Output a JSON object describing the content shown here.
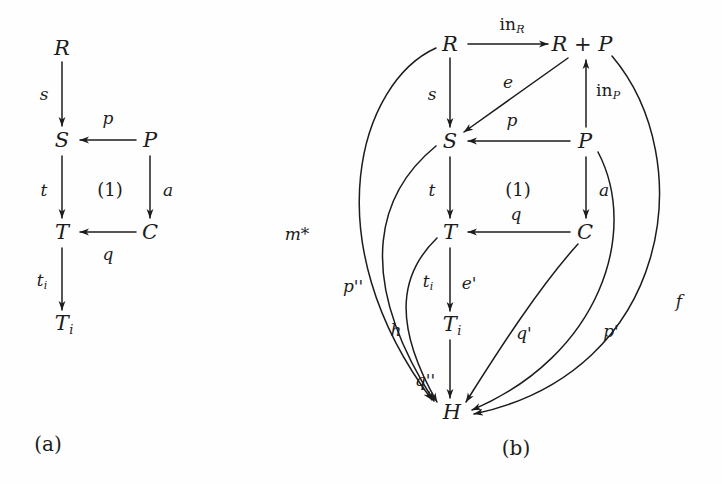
{
  "figure": {
    "background_color": "#fefefe",
    "ink_color": "#1c1c1c",
    "captions": [
      {
        "id": "cap-a",
        "text": "(a)",
        "x": 48,
        "y": 444
      },
      {
        "id": "cap-b",
        "text": "(b)",
        "x": 516,
        "y": 448
      }
    ]
  },
  "diagram_a": {
    "caption": "(a)",
    "nodes": [
      {
        "id": "a-R",
        "label": "R",
        "sub": "",
        "x": 62,
        "y": 48
      },
      {
        "id": "a-S",
        "label": "S",
        "sub": "",
        "x": 62,
        "y": 140
      },
      {
        "id": "a-P",
        "label": "P",
        "sub": "",
        "x": 150,
        "y": 140
      },
      {
        "id": "a-T",
        "label": "T",
        "sub": "",
        "x": 62,
        "y": 232
      },
      {
        "id": "a-C",
        "label": "C",
        "sub": "",
        "x": 150,
        "y": 232
      },
      {
        "id": "a-Ti",
        "label": "T",
        "sub": "i",
        "x": 62,
        "y": 324
      }
    ],
    "edges": [
      {
        "id": "a-s",
        "from": "R",
        "to": "S",
        "label": "s",
        "sub": "",
        "lx": 44,
        "ly": 94
      },
      {
        "id": "a-p",
        "from": "P",
        "to": "S",
        "label": "p",
        "sub": "",
        "lx": 108,
        "ly": 118
      },
      {
        "id": "a-t",
        "from": "S",
        "to": "T",
        "label": "t",
        "sub": "",
        "lx": 44,
        "ly": 190
      },
      {
        "id": "a-a",
        "from": "P",
        "to": "C",
        "label": "a",
        "sub": "",
        "lx": 168,
        "ly": 190
      },
      {
        "id": "a-q",
        "from": "C",
        "to": "T",
        "label": "q",
        "sub": "",
        "lx": 108,
        "ly": 254
      },
      {
        "id": "a-ti",
        "from": "T",
        "to": "Ti",
        "label": "t",
        "sub": "i",
        "lx": 42,
        "ly": 282
      }
    ],
    "square_marker": {
      "text": "(1)",
      "x": 110,
      "y": 190
    }
  },
  "diagram_b": {
    "caption": "(b)",
    "nodes": [
      {
        "id": "b-R",
        "label": "R",
        "sub": "",
        "x": 450,
        "y": 44
      },
      {
        "id": "b-RP",
        "label": "R + P",
        "sub": "",
        "x": 582,
        "y": 44
      },
      {
        "id": "b-S",
        "label": "S",
        "sub": "",
        "x": 450,
        "y": 141
      },
      {
        "id": "b-P",
        "label": "P",
        "sub": "",
        "x": 585,
        "y": 141
      },
      {
        "id": "b-T",
        "label": "T",
        "sub": "",
        "x": 450,
        "y": 232
      },
      {
        "id": "b-C",
        "label": "C",
        "sub": "",
        "x": 585,
        "y": 232
      },
      {
        "id": "b-Ti",
        "label": "T",
        "sub": "i",
        "x": 450,
        "y": 325
      },
      {
        "id": "b-H",
        "label": "H",
        "sub": "",
        "x": 452,
        "y": 412
      }
    ],
    "edges": [
      {
        "id": "b-inR",
        "from": "R",
        "to": "RP",
        "label": "in",
        "sub": "R",
        "roman": true,
        "lx": 512,
        "ly": 26
      },
      {
        "id": "b-inP",
        "from": "P",
        "to": "RP",
        "label": "in",
        "sub": "P",
        "roman": true,
        "lx": 606,
        "ly": 92
      },
      {
        "id": "b-e",
        "from": "RP",
        "to": "S",
        "label": "e",
        "sub": "",
        "roman": false,
        "lx": 508,
        "ly": 82
      },
      {
        "id": "b-s",
        "from": "R",
        "to": "S",
        "label": "s",
        "sub": "",
        "roman": false,
        "lx": 432,
        "ly": 94
      },
      {
        "id": "b-p",
        "from": "P",
        "to": "S",
        "label": "p",
        "sub": "",
        "roman": false,
        "lx": 512,
        "ly": 120
      },
      {
        "id": "b-t",
        "from": "S",
        "to": "T",
        "label": "t",
        "sub": "",
        "roman": false,
        "lx": 432,
        "ly": 190
      },
      {
        "id": "b-a",
        "from": "P",
        "to": "C",
        "label": "a",
        "sub": "",
        "roman": false,
        "lx": 604,
        "ly": 190
      },
      {
        "id": "b-q",
        "from": "C",
        "to": "T",
        "label": "q",
        "sub": "",
        "roman": false,
        "lx": 516,
        "ly": 214
      },
      {
        "id": "b-ti",
        "from": "T",
        "to": "Ti",
        "label": "t",
        "sub": "i",
        "roman": false,
        "lx": 428,
        "ly": 283
      },
      {
        "id": "b-ep",
        "from": "T",
        "to": "Ti",
        "label": "e'",
        "sub": "",
        "roman": false,
        "lx": 468,
        "ly": 283
      },
      {
        "id": "b-mstar",
        "from": "R",
        "to": "H",
        "label": "m*",
        "sub": "",
        "roman": false,
        "lx": 297,
        "ly": 234
      },
      {
        "id": "b-ppp",
        "from": "S",
        "to": "H",
        "label": "p''",
        "sub": "",
        "roman": false,
        "lx": 352,
        "ly": 286
      },
      {
        "id": "b-h",
        "from": "T",
        "to": "H",
        "label": "h",
        "sub": "",
        "roman": false,
        "lx": 396,
        "ly": 330
      },
      {
        "id": "b-qpp",
        "from": "Ti",
        "to": "H",
        "label": "q''",
        "sub": "",
        "roman": false,
        "lx": 424,
        "ly": 380
      },
      {
        "id": "b-qp",
        "from": "C",
        "to": "H",
        "label": "q'",
        "sub": "",
        "roman": false,
        "lx": 524,
        "ly": 333
      },
      {
        "id": "b-pp",
        "from": "P",
        "to": "H",
        "label": "p'",
        "sub": "",
        "roman": false,
        "lx": 611,
        "ly": 331
      },
      {
        "id": "b-f",
        "from": "RP",
        "to": "H",
        "label": "f",
        "sub": "",
        "roman": false,
        "lx": 679,
        "ly": 301
      }
    ],
    "square_marker": {
      "text": "(1)",
      "x": 518,
      "y": 190
    }
  }
}
